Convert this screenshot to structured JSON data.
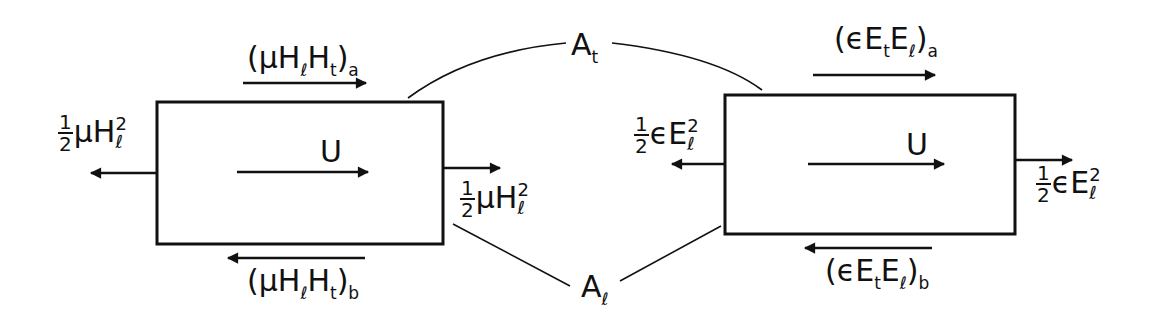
{
  "diagram": {
    "colors": {
      "ink": "#111111",
      "background": "#ffffff"
    },
    "left_element": {
      "velocity_label": "U",
      "top_flux": {
        "open": "(",
        "mu": "μ",
        "H1": "H",
        "sub1": "ℓ",
        "H2": "H",
        "sub2": "t",
        "close": ")",
        "tag": "a"
      },
      "bottom_flux": {
        "open": "(",
        "mu": "μ",
        "H1": "H",
        "sub1": "ℓ",
        "H2": "H",
        "sub2": "t",
        "close": ")",
        "tag": "b"
      },
      "left_pressure": {
        "num": "1",
        "den": "2",
        "coef": "μ",
        "var": "H",
        "sub": "ℓ",
        "exp": "2"
      },
      "right_pressure": {
        "num": "1",
        "den": "2",
        "coef": "μ",
        "var": "H",
        "sub": "ℓ",
        "exp": "2"
      }
    },
    "right_element": {
      "velocity_label": "U",
      "top_flux": {
        "open": "(",
        "eps": "ϵ",
        "E1": "E",
        "sub1": "t",
        "E2": "E",
        "sub2": "ℓ",
        "close": ")",
        "tag": "a"
      },
      "bottom_flux": {
        "open": "(",
        "eps": "ϵ",
        "E1": "E",
        "sub1": "t",
        "E2": "E",
        "sub2": "ℓ",
        "close": ")",
        "tag": "b"
      },
      "left_pressure": {
        "num": "1",
        "den": "2",
        "coef": "ϵ",
        "var": "E",
        "sub": "ℓ",
        "exp": "2"
      },
      "right_pressure": {
        "num": "1",
        "den": "2",
        "coef": "ϵ",
        "var": "E",
        "sub": "ℓ",
        "exp": "2"
      }
    },
    "area_labels": {
      "transverse": {
        "var": "A",
        "sub": "t"
      },
      "longitudinal": {
        "var": "A",
        "sub": "ℓ"
      }
    }
  }
}
